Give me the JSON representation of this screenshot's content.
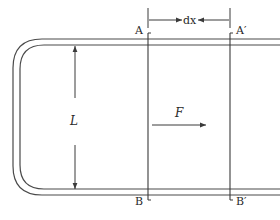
{
  "diagram": {
    "labels": {
      "A": "A",
      "A_prime": "A′",
      "B": "B",
      "B_prime": "B′",
      "dx": "dx",
      "L": "L",
      "F": "F"
    },
    "colors": {
      "line": "#4a4a4a",
      "text": "#2a2a2a",
      "background": "#ffffff"
    }
  }
}
